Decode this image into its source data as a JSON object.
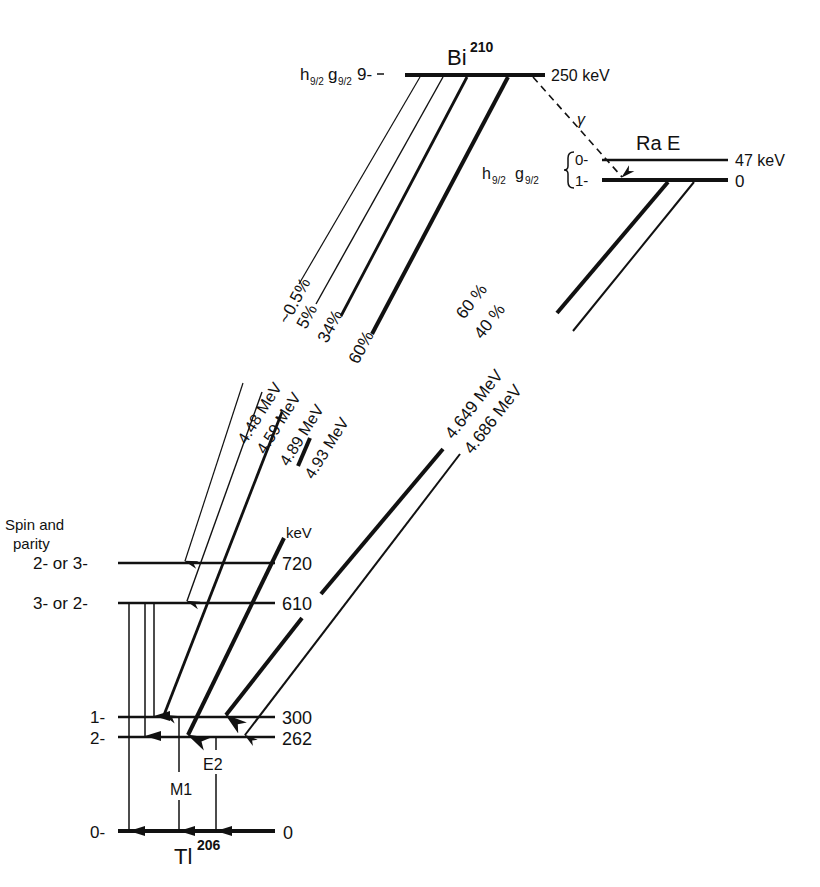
{
  "diagram": {
    "type": "nuclear-decay-level-scheme",
    "parent": {
      "element": "Bi",
      "mass": "210",
      "config_left": "h",
      "config_sub1": "9/2",
      "config_mid": "g",
      "config_sub2": "9/2",
      "spin": "9-",
      "energy": "250 keV"
    },
    "isomer": {
      "name": "Ra E",
      "config_left": "h",
      "config_sub1": "9/2",
      "config_mid": "g",
      "config_sub2": "9/2",
      "levels": [
        {
          "spin": "0-",
          "energy": "47 keV"
        },
        {
          "spin": "1-",
          "energy": "0"
        }
      ],
      "gamma_label": "γ"
    },
    "daughter": {
      "element": "Tl",
      "mass": "206",
      "spin_header_1": "Spin and",
      "spin_header_2": "parity",
      "energy_unit": "keV",
      "levels": [
        {
          "spin": "2- or 3-",
          "energy": "720"
        },
        {
          "spin": "3- or 2-",
          "energy": "610"
        },
        {
          "spin": "1-",
          "energy": "300"
        },
        {
          "spin": "2-",
          "energy": "262"
        },
        {
          "spin": "0-",
          "energy": "0"
        }
      ]
    },
    "bi_transitions": [
      {
        "intensity": "~0.5%",
        "energy": "4.48 MeV",
        "to": "720"
      },
      {
        "intensity": "5%",
        "energy": "4.59 MeV",
        "to": "610"
      },
      {
        "intensity": "34%",
        "energy": "4.89 MeV",
        "to": "300"
      },
      {
        "intensity": "60%",
        "energy": "4.93 MeV",
        "to": "262"
      }
    ],
    "rae_transitions": [
      {
        "intensity": "60 %",
        "energy": "4.649 MeV",
        "to": "300"
      },
      {
        "intensity": "40 %",
        "energy": "4.686 MeV",
        "to": "262"
      }
    ],
    "gamma_transitions": [
      {
        "from": "610",
        "to": "0",
        "label": ""
      },
      {
        "from": "610",
        "to": "262",
        "label": ""
      },
      {
        "from": "610",
        "to": "300",
        "label": ""
      },
      {
        "from": "300",
        "to": "0",
        "label": "M1"
      },
      {
        "from": "262",
        "to": "0",
        "label": "E2"
      }
    ]
  }
}
